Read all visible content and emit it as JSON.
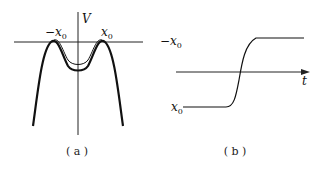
{
  "figure": {
    "panel_a": {
      "caption": "( a )",
      "y_axis_label": "V",
      "left_max_label": "−x",
      "left_max_sub": "0",
      "right_max_label": "x",
      "right_max_sub": "0"
    },
    "panel_b": {
      "caption": "( b )",
      "top_level_label": "−x",
      "top_level_sub": "0",
      "bottom_level_label": "x",
      "bottom_level_sub": "0",
      "x_axis_label": "t"
    }
  }
}
